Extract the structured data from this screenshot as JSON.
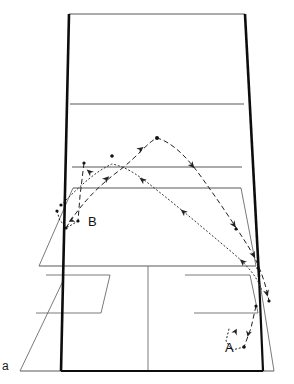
{
  "figure": {
    "panel_label": "a",
    "caption_type": "badminton-court-perspective-diagram",
    "background_color": "#ffffff",
    "court_line_color": "#555555",
    "court_outline_color": "#111111",
    "trajectory_color": "#222222"
  },
  "court": {
    "name": "badminton-court",
    "outline_points": "69,14 245,14 274,371 20,371",
    "thick_left_edge": "69,14 63,281",
    "thick_right_edge": "245,14 259,277",
    "lines": [
      {
        "name": "far-baseline",
        "points": "69,14 245,14"
      },
      {
        "name": "far-service-line",
        "points": "71,105 243,105"
      },
      {
        "name": "far-short-line",
        "points": "73,168 241,168"
      },
      {
        "name": "net-line",
        "points": "74,188 240,188"
      },
      {
        "name": "near-short-line",
        "points": "39,266 256,266"
      },
      {
        "name": "near-baseline",
        "points": "20,371 274,371"
      },
      {
        "name": "centre-line-near",
        "points": "148,266 148,371"
      },
      {
        "name": "left-sideline-inner",
        "points": "74,188 39,266"
      },
      {
        "name": "right-sideline-inner",
        "points": "240,188 256,266"
      },
      {
        "name": "left-sideline-outer",
        "points": "63,281 20,371"
      },
      {
        "name": "right-sideline-outer",
        "points": "259,277 274,371"
      },
      {
        "name": "left-service-box-top",
        "points": "46,275 110,275"
      },
      {
        "name": "left-service-box-bottom",
        "points": "36,313 101,313"
      },
      {
        "name": "left-service-box-side",
        "points": "110,275 101,313"
      },
      {
        "name": "right-service-box-top",
        "points": "185,275 250,275"
      },
      {
        "name": "right-service-box-bottom",
        "points": "194,313 258,313"
      },
      {
        "name": "right-service-box-side",
        "points": "185,275 194,313"
      }
    ]
  },
  "trajectories": [
    {
      "id": "B",
      "label": "B",
      "style": "dashed",
      "description": "clear-shot-arc-from-near-left-to-far-right",
      "path": "M 66,228 L 79,203 L 95,190 L 118,172 L 138,152 L 157,138 L 177,150 L 193,167 L 208,186 L 222,206 L 236,227 L 249,248 L 258,268 L 264,285 L 268,300",
      "markers": [
        {
          "x": 66,
          "y": 228,
          "kind": "dot"
        },
        {
          "x": 81,
          "y": 171,
          "kind": "dot"
        },
        {
          "x": 157,
          "y": 138,
          "kind": "dot"
        },
        {
          "x": 236,
          "y": 227,
          "kind": "dot"
        },
        {
          "x": 258,
          "y": 268,
          "kind": "dot"
        },
        {
          "x": 268,
          "y": 300,
          "kind": "dot"
        }
      ],
      "arrows": [
        {
          "x": 101,
          "y": 183,
          "angle": -44
        },
        {
          "x": 138,
          "y": 152,
          "angle": -42
        },
        {
          "x": 190,
          "y": 162,
          "angle": 49
        },
        {
          "x": 231,
          "y": 221,
          "angle": 56
        },
        {
          "x": 252,
          "y": 252,
          "angle": 64
        },
        {
          "x": 266,
          "y": 292,
          "angle": 72
        }
      ]
    },
    {
      "id": "A",
      "label": "A",
      "style": "dotted",
      "description": "drop-shot-from-far-left-to-near-right",
      "path": "M 61,205 L 82,187 L 96,173 L 112,165 L 130,170 L 145,181 L 165,196 L 185,213 L 205,230 L 225,248 L 244,265 L 258,278 L 262,290",
      "markers": [
        {
          "x": 61,
          "y": 205,
          "kind": "dot"
        },
        {
          "x": 112,
          "y": 156,
          "kind": "dot"
        },
        {
          "x": 185,
          "y": 213,
          "kind": "dot"
        },
        {
          "x": 244,
          "y": 265,
          "kind": "dot"
        },
        {
          "x": 258,
          "y": 320,
          "kind": "dot"
        }
      ],
      "arrows": [
        {
          "x": 92,
          "y": 175,
          "angle": -40
        },
        {
          "x": 145,
          "y": 181,
          "angle": 40
        },
        {
          "x": 186,
          "y": 214,
          "angle": 42
        },
        {
          "x": 245,
          "y": 265,
          "angle": 43
        }
      ]
    },
    {
      "id": "B-bounce",
      "label": "",
      "style": "mixed",
      "description": "near-left-landing-and-rebound-at-B",
      "dashed_path": "M 85,163 L 83,185 L 80,205 L 78,220",
      "dotted_path": "M 78,220 L 70,226 L 62,222 L 58,212",
      "markers": [
        {
          "x": 85,
          "y": 163,
          "kind": "dot"
        },
        {
          "x": 78,
          "y": 220,
          "kind": "dot"
        },
        {
          "x": 58,
          "y": 212,
          "kind": "dot"
        }
      ],
      "arrows": [
        {
          "x": 72,
          "y": 219,
          "angle": 150
        }
      ]
    },
    {
      "id": "A-bounce",
      "label": "",
      "style": "mixed",
      "description": "near-right-landing-and-rebound-at-A",
      "dashed_path": "M 255,310 L 252,325 L 248,338 L 243,347",
      "dotted_path": "M 243,347 L 233,350 L 227,343 L 228,331",
      "markers": [
        {
          "x": 243,
          "y": 347,
          "kind": "dot"
        },
        {
          "x": 255,
          "y": 310,
          "kind": "dot"
        }
      ],
      "arrows": [
        {
          "x": 250,
          "y": 331,
          "angle": 105
        },
        {
          "x": 232,
          "y": 336,
          "angle": -65
        }
      ]
    }
  ],
  "labels": {
    "trajectory_a": "A",
    "trajectory_b": "B",
    "panel": "a"
  }
}
